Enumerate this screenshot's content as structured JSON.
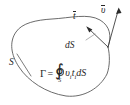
{
  "figure": {
    "background_color": "#ffffff",
    "stroke_color": "#4a4a4a",
    "text_color": "#262626",
    "labels": {
      "tangent_vector": "t",
      "velocity_vector": "υ",
      "surface_element": "dS",
      "surface_name": "S"
    },
    "formula": {
      "left_side": "Γ",
      "equals": "=",
      "integral_symbol": "∮",
      "integral_subscript": "S",
      "integrand_first": "υ",
      "integrand_first_sub": "i",
      "integrand_second": "t",
      "integrand_second_sub": "i",
      "differential": "dS",
      "full_text": "Γ = ∮_S υᵢ tᵢ dS"
    }
  }
}
